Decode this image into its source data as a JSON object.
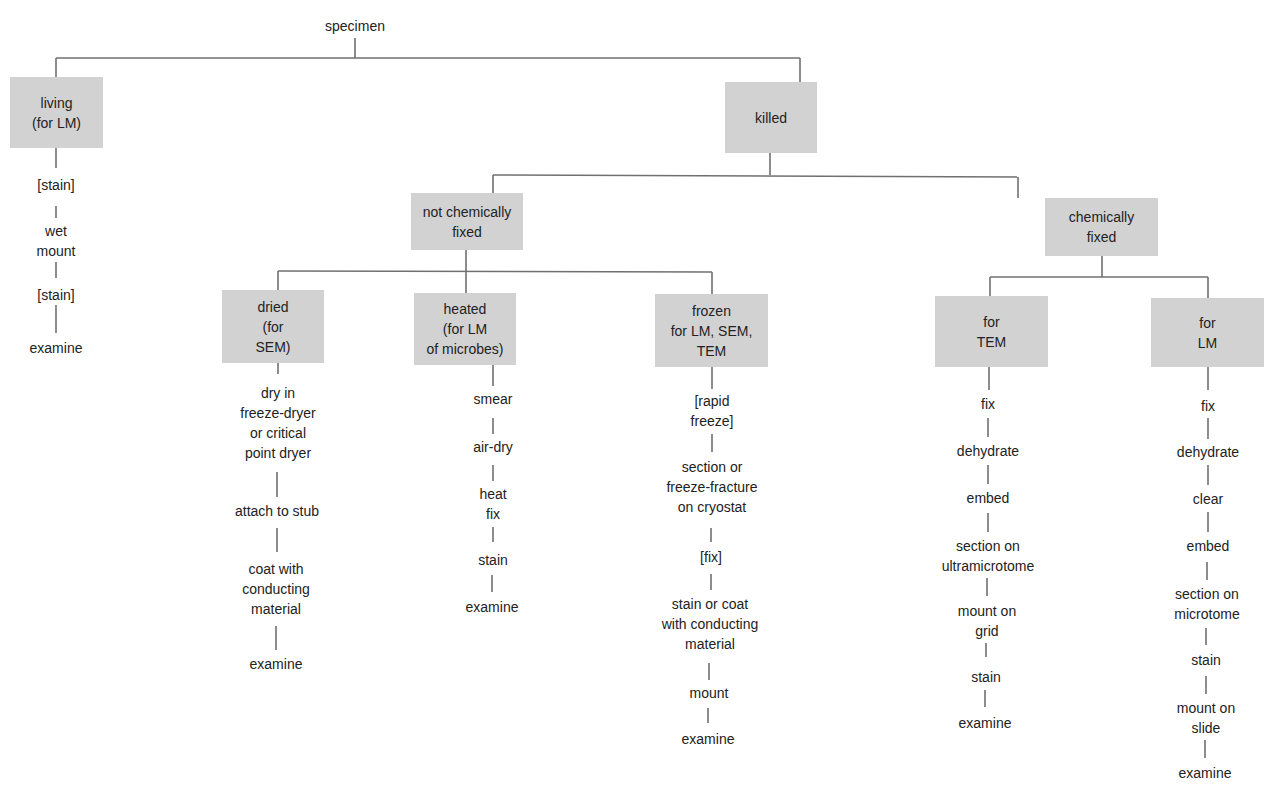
{
  "diagram": {
    "root": "specimen",
    "living": {
      "box": "living\n(for LM)",
      "steps": [
        "[stain]",
        "wet\nmount",
        "[stain]",
        "examine"
      ]
    },
    "killed": {
      "box": "killed",
      "not_chemically_fixed": {
        "box": "not chemically\nfixed",
        "dried": {
          "box": "dried\n(for\nSEM)",
          "steps": [
            "dry in\nfreeze-dryer\nor critical\npoint dryer",
            "attach to stub",
            "coat with\nconducting\nmaterial",
            "examine"
          ]
        },
        "heated": {
          "box": "heated\n(for LM\nof microbes)",
          "steps": [
            "smear",
            "air-dry",
            "heat\nfix",
            "stain",
            "examine"
          ]
        },
        "frozen": {
          "box": "frozen\nfor LM, SEM,\nTEM",
          "steps": [
            "[rapid\nfreeze]",
            "section or\nfreeze-fracture\non cryostat",
            "[fix]",
            "stain or coat\nwith conducting\nmaterial",
            "mount",
            "examine"
          ]
        }
      },
      "chemically_fixed": {
        "box": "chemically\nfixed",
        "for_tem": {
          "box": "for\nTEM",
          "steps": [
            "fix",
            "dehydrate",
            "embed",
            "section on\nultramicrotome",
            "mount on\ngrid",
            "stain",
            "examine"
          ]
        },
        "for_lm": {
          "box": "for\nLM",
          "steps": [
            "fix",
            "dehydrate",
            "clear",
            "embed",
            "section on\nmicrotome",
            "stain",
            "mount on\nslide",
            "examine"
          ]
        }
      }
    }
  },
  "colors": {
    "box_fill": "#d2d2d2",
    "line": "#707070",
    "text": "#222222"
  }
}
